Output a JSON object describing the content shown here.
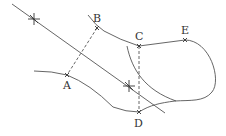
{
  "diagram": {
    "type": "geometry-construction",
    "points": [
      {
        "id": "A",
        "label": "A",
        "x": 67,
        "y": 75,
        "label_x": 63,
        "label_y": 89
      },
      {
        "id": "B",
        "label": "B",
        "x": 97,
        "y": 28,
        "label_x": 93,
        "label_y": 22
      },
      {
        "id": "C",
        "label": "C",
        "x": 139,
        "y": 46,
        "label_x": 135,
        "label_y": 40
      },
      {
        "id": "D",
        "label": "D",
        "x": 139,
        "y": 112,
        "label_x": 134,
        "label_y": 127
      },
      {
        "id": "E",
        "label": "E",
        "x": 185,
        "y": 40,
        "label_x": 181,
        "label_y": 34
      }
    ],
    "star_marks": [
      {
        "x": 34,
        "y": 19
      },
      {
        "x": 129,
        "y": 86
      }
    ],
    "dashed_segments": [
      {
        "from": "B",
        "to": "A"
      },
      {
        "from": "C",
        "to": "D"
      }
    ],
    "colors": {
      "line": "#555555",
      "label": "#333333",
      "background": "#ffffff"
    }
  }
}
